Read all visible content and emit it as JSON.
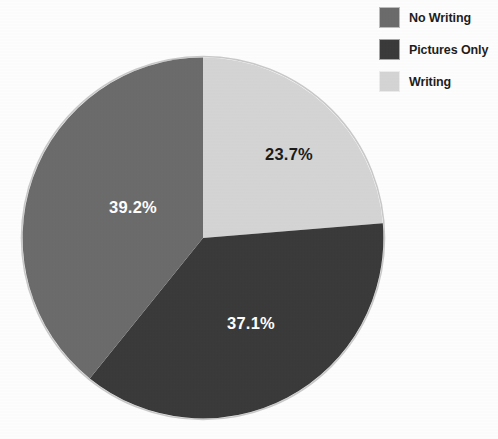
{
  "chart_data": {
    "type": "pie",
    "title": "",
    "labels": [
      "No Writing",
      "Pictures Only",
      "Writing"
    ],
    "values": [
      39.2,
      37.1,
      23.7
    ],
    "value_labels": [
      "39.2%",
      "37.1%",
      "23.7%"
    ],
    "colors": [
      "#6b6b6b",
      "#3a3a3a",
      "#d4d4d4"
    ],
    "units": "percent",
    "legend_position": "top-right",
    "start_angle_deg": 0,
    "direction": "clockwise",
    "slices": [
      {
        "label": "Writing",
        "value": 23.7,
        "value_label": "23.7%",
        "color": "#d4d4d4",
        "label_color": "#1b1b1b",
        "label_x": 289,
        "label_y": 160
      },
      {
        "label": "Pictures Only",
        "value": 37.1,
        "value_label": "37.1%",
        "color": "#3a3a3a",
        "label_color": "#ffffff",
        "label_x": 251,
        "label_y": 329
      },
      {
        "label": "No Writing",
        "value": 39.2,
        "value_label": "39.2%",
        "color": "#6b6b6b",
        "label_color": "#ffffff",
        "label_x": 133,
        "label_y": 213
      }
    ]
  },
  "legend": {
    "items": [
      {
        "label": "No Writing",
        "color": "#6b6b6b"
      },
      {
        "label": "Pictures Only",
        "color": "#3a3a3a"
      },
      {
        "label": "Writing",
        "color": "#d4d4d4"
      }
    ]
  }
}
